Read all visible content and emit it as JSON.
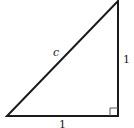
{
  "diagram": {
    "type": "right-triangle",
    "labels": {
      "hypotenuse": "c",
      "vertical_leg": "1",
      "horizontal_leg": "1"
    },
    "right_angle_marker": true,
    "colors": {
      "stroke": "#1a1a1a",
      "background": "#ffffff"
    }
  }
}
